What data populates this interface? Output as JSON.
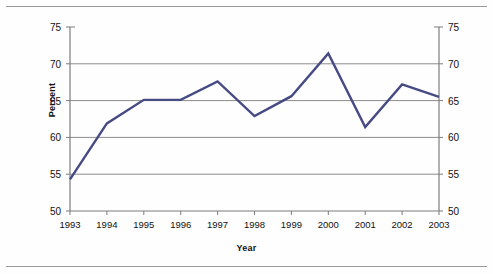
{
  "chart_data": {
    "type": "line",
    "title": "",
    "xlabel": "Year",
    "ylabel": "Percent",
    "categories": [
      "1993",
      "1994",
      "1995",
      "1996",
      "1997",
      "1998",
      "1999",
      "2000",
      "2001",
      "2002",
      "2003"
    ],
    "x": [
      1993,
      1994,
      1995,
      1996,
      1997,
      1998,
      1999,
      2000,
      2001,
      2002,
      2003
    ],
    "values": [
      54.3,
      61.9,
      65.1,
      65.1,
      67.6,
      62.9,
      65.6,
      71.4,
      61.4,
      67.2,
      65.5
    ],
    "series": [
      {
        "name": "Percent",
        "values": [
          54.3,
          61.9,
          65.1,
          65.1,
          67.6,
          62.9,
          65.6,
          71.4,
          61.4,
          67.2,
          65.5
        ]
      }
    ],
    "ylim": [
      50,
      75
    ],
    "yticks": [
      50,
      55,
      60,
      65,
      70,
      75
    ],
    "ytick_labels_left": [
      "50",
      "55",
      "60",
      "65",
      "70",
      "75"
    ],
    "ytick_labels_right": [
      "50",
      "55",
      "60",
      "65",
      "70",
      "75"
    ],
    "xtick_labels": [
      "1993",
      "1994",
      "1995",
      "1996",
      "1997",
      "1998",
      "1999",
      "2000",
      "2001",
      "2002",
      "2003"
    ],
    "grid": "horizontal",
    "legend": "none",
    "line_color": "#474b84",
    "grid_color": "#8c8c8c",
    "axis_color": "#7d7d7d",
    "background_color": "#ffffff",
    "dual_y_axis": true
  },
  "axes": {
    "y_left_label": "Percent",
    "y_right_label": "",
    "x_label": "Year"
  }
}
